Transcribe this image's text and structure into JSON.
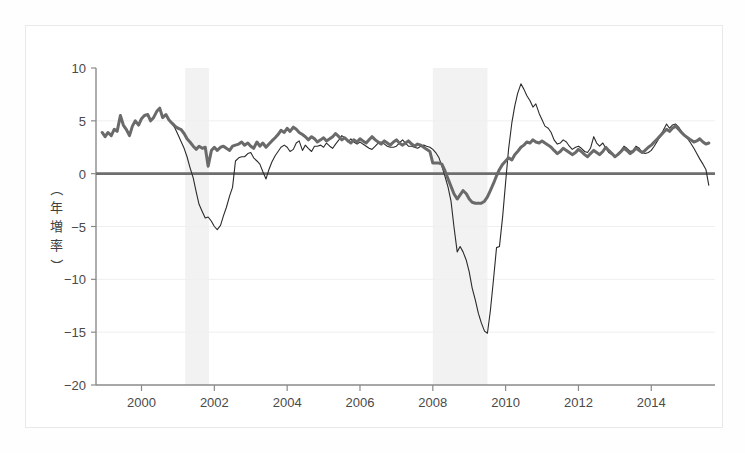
{
  "figure": {
    "background": "#ffffff",
    "frame_color": "#e9e9e9"
  },
  "chart_data": {
    "type": "line",
    "title": "",
    "subtitle": "",
    "xlabel": "",
    "ylabel": "（年増率）",
    "xlim": [
      1998.75,
      2015.75
    ],
    "ylim": [
      -20,
      10
    ],
    "grid": true,
    "grid_color": "#efefef",
    "legend_position": "none",
    "zero_line": {
      "value": 0,
      "color": "#6e6e6e",
      "width": 2.6
    },
    "xticks": [
      2000,
      2002,
      2004,
      2006,
      2008,
      2010,
      2012,
      2014
    ],
    "xtick_labels": [
      "2000",
      "2002",
      "2004",
      "2006",
      "2008",
      "2010",
      "2012",
      "2014"
    ],
    "yticks": [
      10,
      5,
      0,
      -5,
      -10,
      -15,
      -20
    ],
    "ytick_labels": [
      "10",
      "5",
      "0",
      "−5",
      "−10",
      "−15",
      "−20"
    ],
    "shaded_bands": [
      {
        "name": "recession-2001",
        "x0": 2001.2,
        "x1": 2001.85,
        "color": "#f2f2f2"
      },
      {
        "name": "recession-2008",
        "x0": 2008.0,
        "x1": 2009.5,
        "color": "#f2f2f2"
      }
    ],
    "series": [
      {
        "name": "thin-black-series",
        "color": "#2b2b2b",
        "width": 1.1,
        "x": [
          1998.92,
          1999.0,
          1999.08,
          1999.17,
          1999.25,
          1999.33,
          1999.42,
          1999.5,
          1999.58,
          1999.67,
          1999.75,
          1999.83,
          1999.92,
          2000.0,
          2000.08,
          2000.17,
          2000.25,
          2000.33,
          2000.42,
          2000.5,
          2000.58,
          2000.67,
          2000.75,
          2000.83,
          2000.92,
          2001.0,
          2001.08,
          2001.17,
          2001.25,
          2001.33,
          2001.42,
          2001.5,
          2001.58,
          2001.67,
          2001.75,
          2001.83,
          2001.92,
          2002.0,
          2002.08,
          2002.17,
          2002.25,
          2002.33,
          2002.42,
          2002.5,
          2002.58,
          2002.67,
          2002.75,
          2002.83,
          2002.92,
          2003.0,
          2003.08,
          2003.17,
          2003.25,
          2003.33,
          2003.42,
          2003.5,
          2003.58,
          2003.67,
          2003.75,
          2003.83,
          2003.92,
          2004.0,
          2004.08,
          2004.17,
          2004.25,
          2004.33,
          2004.42,
          2004.5,
          2004.58,
          2004.67,
          2004.75,
          2004.83,
          2004.92,
          2005.0,
          2005.08,
          2005.17,
          2005.25,
          2005.33,
          2005.42,
          2005.5,
          2005.58,
          2005.67,
          2005.75,
          2005.83,
          2005.92,
          2006.0,
          2006.08,
          2006.17,
          2006.25,
          2006.33,
          2006.42,
          2006.5,
          2006.58,
          2006.67,
          2006.75,
          2006.83,
          2006.92,
          2007.0,
          2007.08,
          2007.17,
          2007.25,
          2007.33,
          2007.42,
          2007.5,
          2007.58,
          2007.67,
          2007.75,
          2007.83,
          2007.92,
          2008.0,
          2008.08,
          2008.17,
          2008.25,
          2008.33,
          2008.42,
          2008.5,
          2008.58,
          2008.67,
          2008.75,
          2008.83,
          2008.92,
          2009.0,
          2009.08,
          2009.17,
          2009.25,
          2009.33,
          2009.42,
          2009.5,
          2009.58,
          2009.67,
          2009.75,
          2009.83,
          2009.92,
          2010.0,
          2010.08,
          2010.17,
          2010.25,
          2010.33,
          2010.42,
          2010.5,
          2010.58,
          2010.67,
          2010.75,
          2010.83,
          2010.92,
          2011.0,
          2011.08,
          2011.17,
          2011.25,
          2011.33,
          2011.42,
          2011.5,
          2011.58,
          2011.67,
          2011.75,
          2011.83,
          2011.92,
          2012.0,
          2012.08,
          2012.17,
          2012.25,
          2012.33,
          2012.42,
          2012.5,
          2012.58,
          2012.67,
          2012.75,
          2012.83,
          2012.92,
          2013.0,
          2013.08,
          2013.17,
          2013.25,
          2013.33,
          2013.42,
          2013.5,
          2013.58,
          2013.67,
          2013.75,
          2013.83,
          2013.92,
          2014.0,
          2014.08,
          2014.17,
          2014.25,
          2014.33,
          2014.42,
          2014.5,
          2014.58,
          2014.67,
          2014.75,
          2014.83,
          2014.92,
          2015.0,
          2015.08,
          2015.17,
          2015.25,
          2015.33,
          2015.42,
          2015.5,
          2015.58
        ],
        "y": [
          3.9,
          3.5,
          3.9,
          3.6,
          4.2,
          4.0,
          5.5,
          4.6,
          4.2,
          3.6,
          4.5,
          5.0,
          4.6,
          5.2,
          5.5,
          5.6,
          5.0,
          5.3,
          5.9,
          6.2,
          5.3,
          5.6,
          5.1,
          4.8,
          4.3,
          3.7,
          3.1,
          2.4,
          1.6,
          0.6,
          -0.4,
          -1.7,
          -2.9,
          -3.6,
          -4.2,
          -4.1,
          -4.5,
          -5.0,
          -5.3,
          -4.9,
          -4.0,
          -3.2,
          -2.1,
          -1.3,
          1.2,
          1.5,
          1.6,
          1.6,
          1.9,
          2.0,
          1.5,
          1.2,
          0.9,
          0.2,
          -0.5,
          0.4,
          1.1,
          1.7,
          2.1,
          2.5,
          2.7,
          2.5,
          2.1,
          2.3,
          2.9,
          3.1,
          2.2,
          2.7,
          2.4,
          2.1,
          2.6,
          2.6,
          2.7,
          2.5,
          2.9,
          2.6,
          2.4,
          2.8,
          3.2,
          3.6,
          3.4,
          3.0,
          3.3,
          3.0,
          2.8,
          3.0,
          2.8,
          2.6,
          2.4,
          2.3,
          2.6,
          2.9,
          3.0,
          2.8,
          2.6,
          2.5,
          2.5,
          2.6,
          2.9,
          3.2,
          2.9,
          2.6,
          2.6,
          2.5,
          2.4,
          2.6,
          2.7,
          2.6,
          2.5,
          2.3,
          2.0,
          1.5,
          0.7,
          -0.2,
          -1.3,
          -2.6,
          -5.0,
          -7.4,
          -6.9,
          -7.4,
          -8.2,
          -9.3,
          -10.8,
          -12.0,
          -13.2,
          -14.1,
          -14.9,
          -15.1,
          -13.0,
          -9.9,
          -7.0,
          -6.9,
          -4.0,
          -0.8,
          2.3,
          4.8,
          6.4,
          7.6,
          8.5,
          8.0,
          7.4,
          6.9,
          6.3,
          6.6,
          5.7,
          5.1,
          4.5,
          4.3,
          3.9,
          3.2,
          2.8,
          2.9,
          3.2,
          3.0,
          2.6,
          2.3,
          2.5,
          2.6,
          2.4,
          2.1,
          2.0,
          2.4,
          3.5,
          2.9,
          2.6,
          2.9,
          2.4,
          2.0,
          1.8,
          1.6,
          1.9,
          2.2,
          2.6,
          2.4,
          2.1,
          2.2,
          2.6,
          2.4,
          2.0,
          1.9,
          2.0,
          2.2,
          2.6,
          3.1,
          3.6,
          4.1,
          4.7,
          4.3,
          4.6,
          4.7,
          4.4,
          4.0,
          3.6,
          3.3,
          2.9,
          2.4,
          1.9,
          1.4,
          0.9,
          0.4,
          -1.1
        ]
      },
      {
        "name": "thick-gray-series",
        "color": "#6a6a6a",
        "width": 3.0,
        "x": [
          1998.92,
          1999.0,
          1999.08,
          1999.17,
          1999.25,
          1999.33,
          1999.42,
          1999.5,
          1999.58,
          1999.67,
          1999.75,
          1999.83,
          1999.92,
          2000.0,
          2000.08,
          2000.17,
          2000.25,
          2000.33,
          2000.42,
          2000.5,
          2000.58,
          2000.67,
          2000.75,
          2000.83,
          2000.92,
          2001.0,
          2001.08,
          2001.17,
          2001.25,
          2001.33,
          2001.42,
          2001.5,
          2001.58,
          2001.67,
          2001.75,
          2001.83,
          2001.92,
          2002.0,
          2002.08,
          2002.17,
          2002.25,
          2002.33,
          2002.42,
          2002.5,
          2002.58,
          2002.67,
          2002.75,
          2002.83,
          2002.92,
          2003.0,
          2003.08,
          2003.17,
          2003.25,
          2003.33,
          2003.42,
          2003.5,
          2003.58,
          2003.67,
          2003.75,
          2003.83,
          2003.92,
          2004.0,
          2004.08,
          2004.17,
          2004.25,
          2004.33,
          2004.42,
          2004.5,
          2004.58,
          2004.67,
          2004.75,
          2004.83,
          2004.92,
          2005.0,
          2005.08,
          2005.17,
          2005.25,
          2005.33,
          2005.42,
          2005.5,
          2005.58,
          2005.67,
          2005.75,
          2005.83,
          2005.92,
          2006.0,
          2006.08,
          2006.17,
          2006.25,
          2006.33,
          2006.42,
          2006.5,
          2006.58,
          2006.67,
          2006.75,
          2006.83,
          2006.92,
          2007.0,
          2007.08,
          2007.17,
          2007.25,
          2007.33,
          2007.42,
          2007.5,
          2007.58,
          2007.67,
          2007.75,
          2007.83,
          2007.92,
          2008.0,
          2008.08,
          2008.17,
          2008.25,
          2008.33,
          2008.42,
          2008.5,
          2008.58,
          2008.67,
          2008.75,
          2008.83,
          2008.92,
          2009.0,
          2009.08,
          2009.17,
          2009.25,
          2009.33,
          2009.42,
          2009.5,
          2009.58,
          2009.67,
          2009.75,
          2009.83,
          2009.92,
          2010.0,
          2010.08,
          2010.17,
          2010.25,
          2010.33,
          2010.42,
          2010.5,
          2010.58,
          2010.67,
          2010.75,
          2010.83,
          2010.92,
          2011.0,
          2011.08,
          2011.17,
          2011.25,
          2011.33,
          2011.42,
          2011.5,
          2011.58,
          2011.67,
          2011.75,
          2011.83,
          2011.92,
          2012.0,
          2012.08,
          2012.17,
          2012.25,
          2012.33,
          2012.42,
          2012.5,
          2012.58,
          2012.67,
          2012.75,
          2012.83,
          2012.92,
          2013.0,
          2013.08,
          2013.17,
          2013.25,
          2013.33,
          2013.42,
          2013.5,
          2013.58,
          2013.67,
          2013.75,
          2013.83,
          2013.92,
          2014.0,
          2014.08,
          2014.17,
          2014.25,
          2014.33,
          2014.42,
          2014.5,
          2014.58,
          2014.67,
          2014.75,
          2014.83,
          2014.92,
          2015.0,
          2015.08,
          2015.17,
          2015.25,
          2015.33,
          2015.42,
          2015.5,
          2015.58
        ],
        "y": [
          3.9,
          3.5,
          3.9,
          3.6,
          4.2,
          4.0,
          5.5,
          4.6,
          4.2,
          3.6,
          4.5,
          5.0,
          4.6,
          5.2,
          5.5,
          5.6,
          5.0,
          5.3,
          5.9,
          6.2,
          5.3,
          5.6,
          5.1,
          4.8,
          4.5,
          4.3,
          4.2,
          3.8,
          3.3,
          3.0,
          2.6,
          2.3,
          2.6,
          2.4,
          2.5,
          0.7,
          2.2,
          2.5,
          2.2,
          2.5,
          2.6,
          2.4,
          2.2,
          2.6,
          2.7,
          2.8,
          3.0,
          2.7,
          2.9,
          2.6,
          2.4,
          3.0,
          2.6,
          2.9,
          2.5,
          2.8,
          3.1,
          3.4,
          3.7,
          4.1,
          3.9,
          4.3,
          4.0,
          4.4,
          4.2,
          3.9,
          3.7,
          3.5,
          3.2,
          3.5,
          3.3,
          3.0,
          3.2,
          3.4,
          3.1,
          3.3,
          3.5,
          3.8,
          3.5,
          3.2,
          3.4,
          3.1,
          2.9,
          3.2,
          3.0,
          3.3,
          3.1,
          2.9,
          3.2,
          3.5,
          3.2,
          3.0,
          2.8,
          3.1,
          2.9,
          2.7,
          3.0,
          3.2,
          2.9,
          2.7,
          2.9,
          3.1,
          2.8,
          2.6,
          2.8,
          2.7,
          2.5,
          2.3,
          2.1,
          1.0,
          1.0,
          1.0,
          0.9,
          0.3,
          -0.5,
          -1.2,
          -1.9,
          -2.4,
          -2.0,
          -1.6,
          -1.9,
          -2.4,
          -2.7,
          -2.8,
          -2.8,
          -2.8,
          -2.6,
          -2.2,
          -1.6,
          -0.9,
          -0.2,
          0.4,
          0.9,
          1.2,
          1.5,
          1.3,
          1.8,
          2.1,
          2.5,
          2.7,
          3.0,
          2.9,
          3.2,
          3.0,
          2.9,
          3.1,
          2.9,
          2.7,
          2.5,
          2.2,
          1.9,
          2.1,
          2.4,
          2.2,
          2.0,
          1.8,
          2.0,
          2.3,
          2.1,
          1.8,
          1.6,
          1.9,
          2.2,
          2.0,
          1.8,
          2.1,
          2.5,
          2.2,
          1.9,
          1.6,
          1.8,
          2.1,
          2.4,
          2.2,
          1.9,
          2.1,
          2.4,
          2.2,
          2.0,
          2.2,
          2.5,
          2.7,
          3.0,
          3.3,
          3.6,
          3.9,
          4.2,
          4.0,
          4.3,
          4.5,
          4.2,
          3.9,
          3.6,
          3.4,
          3.2,
          3.0,
          3.1,
          3.3,
          3.0,
          2.8,
          2.9
        ]
      }
    ]
  }
}
